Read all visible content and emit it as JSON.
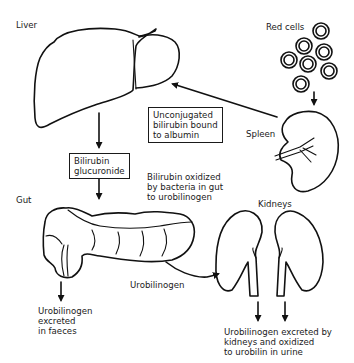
{
  "diagram": {
    "organs": {
      "liver": "Liver",
      "red_cells": "Red cells",
      "spleen": "Spleen",
      "gut": "Gut",
      "kidneys": "Kidneys"
    },
    "boxes": {
      "unconjugated": [
        "Unconjugated",
        "bilirubin bound",
        "to albumin"
      ],
      "glucuronide": [
        "Bilirubin",
        "glucuronide"
      ]
    },
    "notes": {
      "oxidized": [
        "Bilirubin oxidized",
        "by bacteria in gut",
        "to urobilinogen"
      ],
      "urobilinogen": "Urobilinogen",
      "faeces": [
        "Urobilinogen",
        "excreted",
        "in faeces"
      ],
      "urine": [
        "Urobilinogen excreted by",
        "kidneys and oxidized",
        "to urobilin in urine"
      ]
    },
    "colors": {
      "ink": "#111111",
      "background": "#ffffff"
    }
  }
}
